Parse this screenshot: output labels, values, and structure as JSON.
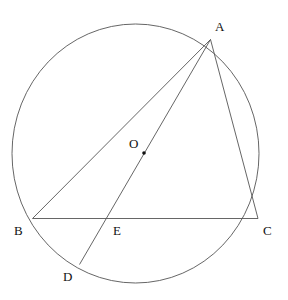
{
  "figure": {
    "kind": "euclidean-geometry-diagram",
    "background_color": "#ffffff",
    "stroke_color": "#555555",
    "label_color": "#111111",
    "stroke_width": 0.9,
    "canvas": {
      "width": 288,
      "height": 300
    }
  },
  "circle": {
    "name": "circumcircle",
    "center_x": 135.5,
    "center_y": 153.5,
    "radius_x": 123.5,
    "radius_y": 129.5
  },
  "center_dot": {
    "name": "center-point-O",
    "x": 144,
    "y": 153,
    "radius": 1.8
  },
  "points": [
    {
      "id": "A",
      "label": "A",
      "x": 210.5,
      "y": 39.5,
      "label_x": 215,
      "label_y": 20,
      "on_circle": true
    },
    {
      "id": "B",
      "label": "B",
      "x": 32.5,
      "y": 218.5,
      "label_x": 14,
      "label_y": 224,
      "on_circle": true
    },
    {
      "id": "C",
      "label": "C",
      "x": 258.0,
      "y": 218.5,
      "label_x": 263,
      "label_y": 224,
      "on_circle": true
    },
    {
      "id": "D",
      "label": "D",
      "x": 79.5,
      "y": 264.5,
      "label_x": 63,
      "label_y": 270,
      "on_circle": true
    },
    {
      "id": "E",
      "label": "E",
      "x": 110.0,
      "y": 218.5,
      "label_x": 113,
      "label_y": 224,
      "on_circle": false
    },
    {
      "id": "O",
      "label": "O",
      "x": 144.0,
      "y": 153.0,
      "label_x": 129,
      "label_y": 137,
      "on_circle": false
    }
  ],
  "segments": [
    {
      "id": "AB",
      "name": "segment-AB",
      "x1": 210.5,
      "y1": 39.5,
      "x2": 32.5,
      "y2": 218.5
    },
    {
      "id": "AC",
      "name": "segment-AC",
      "x1": 210.5,
      "y1": 39.5,
      "x2": 258.0,
      "y2": 218.5
    },
    {
      "id": "AD",
      "name": "segment-AD",
      "x1": 210.5,
      "y1": 39.5,
      "x2": 79.5,
      "y2": 264.5
    },
    {
      "id": "BC",
      "name": "segment-BC",
      "x1": 32.5,
      "y1": 218.5,
      "x2": 258.0,
      "y2": 218.5
    }
  ]
}
